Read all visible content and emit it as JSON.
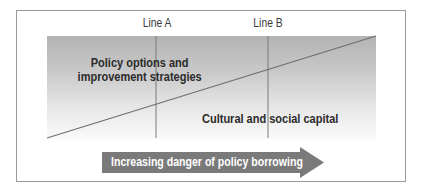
{
  "diagram": {
    "lines": [
      {
        "label": "Line A"
      },
      {
        "label": "Line B"
      }
    ],
    "regions": {
      "upper": {
        "line1": "Policy options and",
        "line2": "improvement strategies"
      },
      "lower": {
        "text": "Cultural and social capital"
      }
    },
    "arrow": {
      "label": "Increasing danger of policy borrowing"
    },
    "colors": {
      "frame": "#9a9a9a",
      "gradient_top": "#b3b3b3",
      "gradient_bottom": "#fbfbfb",
      "line": "#6e6e6e",
      "arrow_fill": "#7a7a7a",
      "arrow_text": "#ffffff",
      "label_text": "#2b2b2b"
    }
  }
}
